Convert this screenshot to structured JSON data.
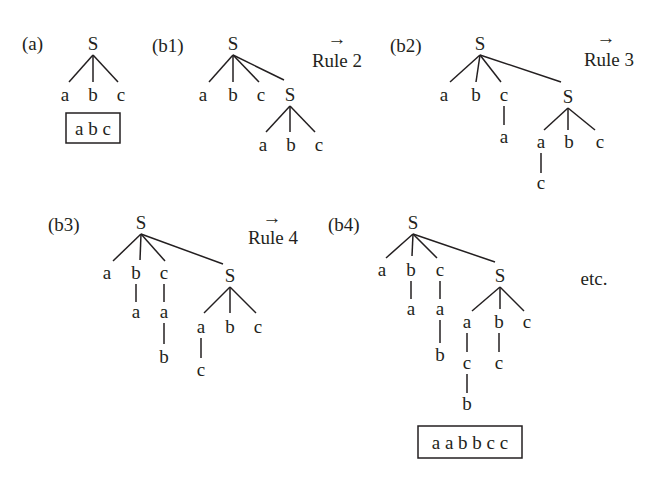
{
  "panels": {
    "a": {
      "label": "(a)",
      "root": "S",
      "leaves": [
        "a",
        "b",
        "c"
      ],
      "result": "a b c"
    },
    "b1": {
      "label": "(b1)",
      "root": "S",
      "children": [
        "a",
        "b",
        "c",
        "S"
      ],
      "sub_children": [
        "a",
        "b",
        "c"
      ],
      "rule": "Rule 2"
    },
    "b2": {
      "label": "(b2)",
      "root": "S",
      "children": [
        "a",
        "b",
        "c",
        "S"
      ],
      "under_c": "a",
      "sub_children": [
        "a",
        "b",
        "c"
      ],
      "under_sub_a": "c",
      "rule": "Rule 3"
    },
    "b3": {
      "label": "(b3)",
      "root": "S",
      "children": [
        "a",
        "b",
        "c",
        "S"
      ],
      "under_b": "a",
      "under_c": [
        "a",
        "b"
      ],
      "sub_children": [
        "a",
        "b",
        "c"
      ],
      "under_sub_a": "c",
      "rule": "Rule 4"
    },
    "b4": {
      "label": "(b4)",
      "root": "S",
      "children": [
        "a",
        "b",
        "c",
        "S"
      ],
      "under_b": "a",
      "under_c": [
        "a",
        "b"
      ],
      "sub_children": [
        "a",
        "b",
        "c"
      ],
      "under_sub_a": [
        "c",
        "b"
      ],
      "under_sub_b": "c",
      "result": "a a b b c c",
      "etc": "etc."
    }
  },
  "arrow_glyph": "→"
}
